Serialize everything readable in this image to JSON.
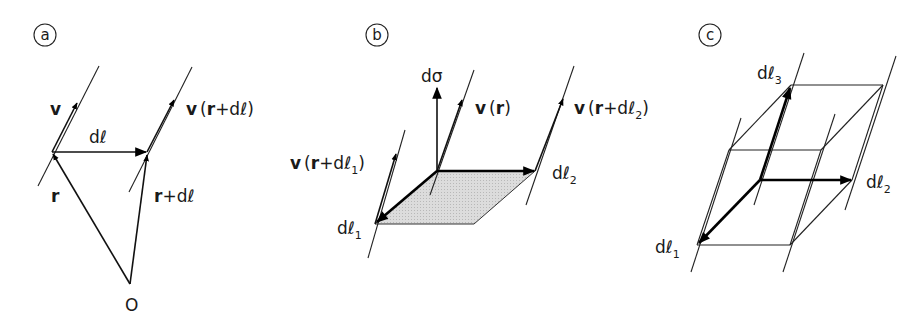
{
  "figure": {
    "panels": [
      {
        "tag": "a",
        "labels": {
          "v": "v",
          "dl": "dℓ",
          "r": "r",
          "r_plus_dl_vec": "r",
          "r_plus_dl_rest": "+dℓ",
          "v_r_dl_v": "v",
          "v_r_dl_open": "(",
          "v_r_dl_r": "r",
          "v_r_dl_rest": "+dℓ)",
          "origin": "O"
        }
      },
      {
        "tag": "b",
        "labels": {
          "dsigma": "dσ",
          "v_r_v": "v",
          "v_r_open": "(",
          "v_r_r": "r",
          "v_r_close": ")",
          "v_r_dl1_v": "v",
          "v_r_dl1_open": "(",
          "v_r_dl1_r": "r",
          "v_r_dl1_rest": "+dℓ",
          "v_r_dl1_sub": "1",
          "v_r_dl1_close": ")",
          "v_r_dl2_v": "v",
          "v_r_dl2_open": "(",
          "v_r_dl2_r": "r",
          "v_r_dl2_rest": "+dℓ",
          "v_r_dl2_sub": "2",
          "v_r_dl2_close": ")",
          "dl1": "dℓ",
          "dl1_sub": "1",
          "dl2": "dℓ",
          "dl2_sub": "2"
        },
        "shade_color": "#d9d9d9"
      },
      {
        "tag": "c",
        "labels": {
          "dl1": "dℓ",
          "dl1_sub": "1",
          "dl2": "dℓ",
          "dl2_sub": "2",
          "dl3": "dℓ",
          "dl3_sub": "3"
        }
      }
    ]
  }
}
